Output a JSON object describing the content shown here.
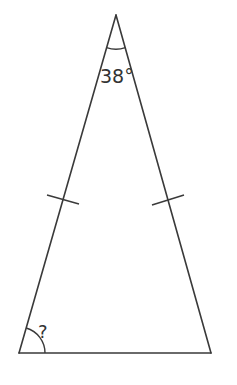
{
  "diagram": {
    "type": "isosceles-triangle",
    "apex_angle_label": "38°",
    "base_angle_label": "?",
    "colors": {
      "stroke": "#3a3a3a",
      "text": "#333333",
      "background": "#ffffff"
    },
    "vertices": {
      "apex": [
        116,
        15
      ],
      "bottom_left": [
        19,
        353
      ],
      "bottom_right": [
        211,
        353
      ]
    },
    "equal_side_marks": 2
  }
}
